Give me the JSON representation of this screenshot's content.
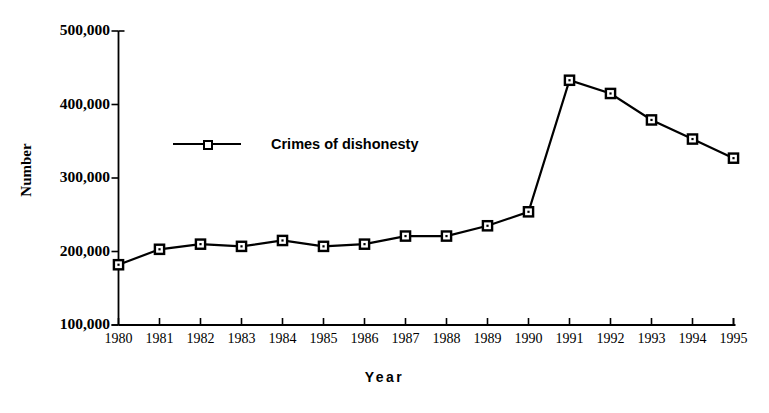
{
  "chart_data": {
    "type": "line",
    "title": "",
    "xlabel": "Year",
    "ylabel": "Number",
    "categories": [
      "1980",
      "1981",
      "1982",
      "1983",
      "1984",
      "1985",
      "1986",
      "1987",
      "1988",
      "1989",
      "1990",
      "1991",
      "1992",
      "1993",
      "1994",
      "1995"
    ],
    "series": [
      {
        "name": "Crimes of dishonesty",
        "values": [
          182000,
          203000,
          210000,
          207000,
          215000,
          207000,
          210000,
          221000,
          221000,
          235000,
          254000,
          433000,
          415000,
          379000,
          353000,
          327000
        ],
        "color": "#000000",
        "marker": "square-open"
      }
    ],
    "ylim": [
      100000,
      500000
    ],
    "yticks": [
      100000,
      200000,
      300000,
      400000,
      500000
    ],
    "ytick_labels": [
      "100,000",
      "200,000",
      "300,000",
      "400,000",
      "500,000"
    ],
    "xtick_labels": [
      "1980",
      "1981",
      "1982",
      "1983",
      "1984",
      "1985",
      "1986",
      "1987",
      "1988",
      "1989",
      "1990",
      "1991",
      "1992",
      "1993",
      "1994",
      "1995"
    ],
    "grid": false,
    "legend_position": "inside-upper-left",
    "background_color": "#ffffff",
    "axis_color": "#000000"
  },
  "legend": {
    "entries": [
      {
        "label": "Crimes of dishonesty"
      }
    ]
  },
  "axes": {
    "y_title": "Number",
    "x_title": "Year"
  }
}
